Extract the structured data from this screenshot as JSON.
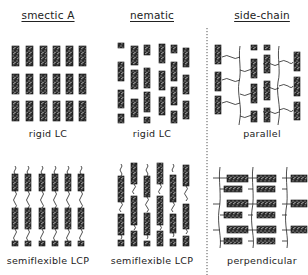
{
  "figure": {
    "columns": [
      {
        "id": "smectic-a",
        "title": "smectic A",
        "title_x": 48
      },
      {
        "id": "nematic",
        "title": "nematic",
        "title_x": 152
      },
      {
        "id": "side-chain",
        "title": "side-chain",
        "title_x": 262
      }
    ],
    "panels": [
      {
        "id": "smectic-rigid",
        "caption": "rigid LC",
        "caption_x": 48,
        "caption_y": 128
      },
      {
        "id": "nematic-rigid",
        "caption": "rigid LC",
        "caption_x": 152,
        "caption_y": 128
      },
      {
        "id": "sidechain-parallel",
        "caption": "parallel",
        "caption_x": 262,
        "caption_y": 128
      },
      {
        "id": "smectic-semiflexible",
        "caption": "semiflexible LCP",
        "caption_x": 48,
        "caption_y": 255
      },
      {
        "id": "nematic-semiflexible",
        "caption": "semiflexible LCP",
        "caption_x": 152,
        "caption_y": 255
      },
      {
        "id": "sidechain-perpendicular",
        "caption": "perpendicular",
        "caption_x": 262,
        "caption_y": 255
      }
    ],
    "divider": {
      "style": "dotted",
      "x": 207,
      "y_start": 28,
      "y_end": 275
    },
    "colors": {
      "mesogen_fill": "#2a2a2a",
      "mesogen_speckle": "#d8d8d8",
      "line": "#333333",
      "background": "#ffffff"
    }
  }
}
